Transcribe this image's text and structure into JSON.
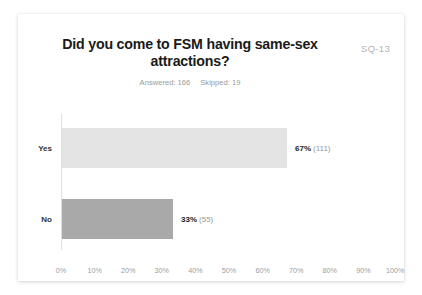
{
  "card": {
    "code_label": "SQ-13",
    "title": "Did you come to FSM having same-sex attractions?",
    "answered_label": "Answered: 166",
    "skipped_label": "Skipped: 19"
  },
  "colors": {
    "bar_yes": "#e4e4e4",
    "bar_no": "#a9a9a9",
    "axis": "#e0e0e0",
    "tick_text": "#9d9d9d",
    "muted_text": "#999999",
    "title_text": "#1a1a1a"
  },
  "chart_data": {
    "type": "bar",
    "orientation": "horizontal",
    "title": "Did you come to FSM having same-sex attractions?",
    "subtitle": "Answered: 166   Skipped: 19",
    "xlabel": "",
    "ylabel": "",
    "xlim": [
      0,
      100
    ],
    "grid": false,
    "legend": "none",
    "categories": [
      "Yes",
      "No"
    ],
    "values": [
      67,
      33
    ],
    "counts": [
      111,
      55
    ],
    "value_labels": [
      "67%",
      "33%"
    ],
    "count_labels": [
      "(111)",
      "(55)"
    ],
    "bar_colors": [
      "#e4e4e4",
      "#a9a9a9"
    ],
    "xticks": [
      0,
      10,
      20,
      30,
      40,
      50,
      60,
      70,
      80,
      90,
      100
    ],
    "xticklabels": [
      "0%",
      "10%",
      "20%",
      "30%",
      "40%",
      "50%",
      "60%",
      "70%",
      "80%",
      "90%",
      "100%"
    ],
    "answered": 166,
    "skipped": 19
  }
}
